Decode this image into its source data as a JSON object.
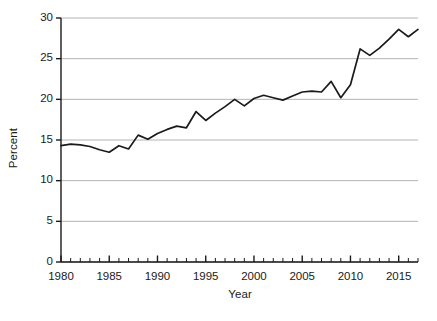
{
  "chart_data": {
    "type": "line",
    "title": "",
    "subtitle": "",
    "xlabel": "Year",
    "ylabel": "Percent",
    "xlim": [
      1980,
      2017
    ],
    "ylim": [
      0,
      30
    ],
    "grid": true,
    "grid_axis": "y",
    "legend": false,
    "legend_position": "none",
    "line_color": "#1a1a1a",
    "grid_color": "#b4b4b4",
    "axis_color": "#1a1a1a",
    "background": "#ffffff",
    "y_ticks": [
      0,
      5,
      10,
      15,
      20,
      25,
      30
    ],
    "y_tick_labels": [
      "0",
      "5",
      "10",
      "15",
      "20",
      "25",
      "30"
    ],
    "x_ticks": [
      1980,
      1985,
      1990,
      1995,
      2000,
      2005,
      2010,
      2015
    ],
    "x_tick_labels": [
      "1980",
      "1985",
      "1990",
      "1995",
      "2000",
      "2005",
      "2010",
      "2015"
    ],
    "x_minor_tick_step": 1,
    "series": [
      {
        "name": "Percent",
        "x": [
          1980,
          1981,
          1982,
          1983,
          1984,
          1985,
          1986,
          1987,
          1988,
          1989,
          1990,
          1991,
          1992,
          1993,
          1994,
          1995,
          1996,
          1997,
          1998,
          1999,
          2000,
          2001,
          2002,
          2003,
          2004,
          2005,
          2006,
          2007,
          2008,
          2009,
          2010,
          2011,
          2012,
          2013,
          2014,
          2015,
          2016,
          2017
        ],
        "values": [
          14.3,
          14.5,
          14.4,
          14.2,
          13.8,
          13.5,
          14.3,
          13.9,
          15.6,
          15.1,
          15.8,
          16.3,
          16.7,
          16.5,
          18.5,
          17.4,
          18.3,
          19.1,
          20.0,
          19.2,
          20.1,
          20.5,
          20.2,
          19.9,
          20.4,
          20.9,
          21.0,
          20.9,
          22.2,
          20.2,
          21.8,
          26.2,
          25.4,
          26.3,
          27.4,
          28.6,
          27.7,
          28.6
        ]
      }
    ]
  },
  "axes": {
    "x_title": "Year",
    "y_title": "Percent"
  }
}
